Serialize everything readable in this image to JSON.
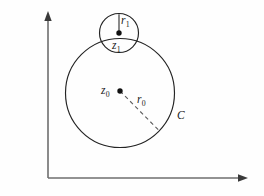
{
  "figure": {
    "background_color": "#fefefe",
    "stroke_color": "#232323",
    "axis_color": "#6e6e6e",
    "labels": {
      "outer_center": "z",
      "outer_center_sub": "0",
      "outer_radius": "r",
      "outer_radius_sub": "0",
      "inner_center": "z",
      "inner_center_sub": "1",
      "inner_radius": "r",
      "inner_radius_sub": "1",
      "contour": "C"
    },
    "axes": {
      "origin": [
        48,
        178
      ],
      "vertical_top": [
        48,
        14
      ],
      "horizontal_right": [
        247,
        178
      ],
      "arrowheads": "filled-triangle"
    },
    "shapes": {
      "outer_circle": {
        "cx": 120,
        "cy": 93,
        "r": 54.5,
        "label": "C"
      },
      "inner_circle": {
        "cx": 119,
        "cy": 33,
        "r": 19.5,
        "label": "z1"
      },
      "outer_center_dot": {
        "cx": 120,
        "cy": 91,
        "r": 2.6
      },
      "inner_center_dot": {
        "cx": 119,
        "cy": 33,
        "r": 2.6
      },
      "outer_radius_line": {
        "x1": 120,
        "y1": 91,
        "x2": 159,
        "y2": 131,
        "style": "dashed"
      },
      "inner_radius_line": {
        "x1": 119,
        "y1": 33,
        "x2": 119,
        "y2": 14.5,
        "style": "solid"
      }
    }
  }
}
